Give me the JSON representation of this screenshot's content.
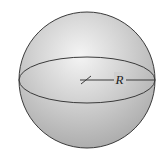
{
  "figure": {
    "radius_label": "R",
    "colors": {
      "background": "#ffffff",
      "sphere_highlight": "#f2f2f2",
      "sphere_shadow": "#a9a9a9",
      "outline": "#3a3a3a"
    }
  }
}
